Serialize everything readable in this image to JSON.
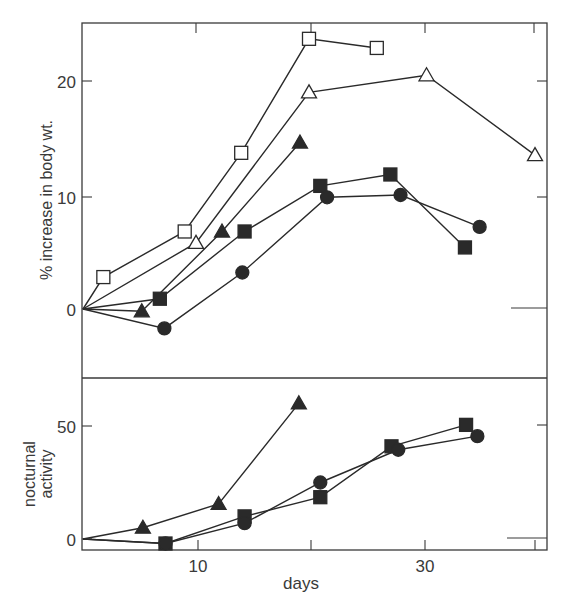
{
  "chart_data": [
    {
      "type": "line",
      "title": "",
      "xlabel": "",
      "ylabel": "% increase in body wt.",
      "xlim": [
        0,
        41
      ],
      "ylim": [
        -6,
        25
      ],
      "x_ticks": [
        10,
        20,
        30,
        40
      ],
      "y_ticks": [
        0,
        10,
        20
      ],
      "y_tick_labels": [
        "0",
        "10",
        "20"
      ],
      "grid": false,
      "legend": "none",
      "series": [
        {
          "name": "open-square",
          "marker": "open-square",
          "x": [
            0,
            1.8,
            9,
            14,
            20,
            26
          ],
          "y": [
            0,
            2.8,
            6.8,
            13.7,
            23.7,
            22.9
          ]
        },
        {
          "name": "open-triangle",
          "marker": "open-triangle",
          "x": [
            0,
            10,
            20,
            30.4,
            40
          ],
          "y": [
            0,
            5.8,
            19,
            20.5,
            13.5
          ]
        },
        {
          "name": "filled-triangle",
          "marker": "filled-triangle",
          "x": [
            0,
            5.2,
            12.3,
            19.2
          ],
          "y": [
            0,
            -0.2,
            6.8,
            14.6
          ]
        },
        {
          "name": "filled-square",
          "marker": "filled-square",
          "x": [
            0,
            6.8,
            14.3,
            21,
            27.2,
            33.8
          ],
          "y": [
            0,
            0.9,
            6.8,
            10.8,
            11.8,
            5.4
          ]
        },
        {
          "name": "filled-circle",
          "marker": "filled-circle",
          "x": [
            0,
            7.2,
            14.1,
            21.6,
            28.1,
            35.1
          ],
          "y": [
            0,
            -1.7,
            3.2,
            9.8,
            10.0,
            7.2
          ]
        }
      ]
    },
    {
      "type": "line",
      "title": "",
      "xlabel": "days",
      "ylabel": "nocturnal activity",
      "xlim": [
        0,
        41
      ],
      "ylim": [
        -5,
        70
      ],
      "x_ticks": [
        10,
        20,
        30,
        40
      ],
      "x_tick_labels": [
        "10",
        "",
        "30",
        ""
      ],
      "y_ticks": [
        0,
        50
      ],
      "y_tick_labels": [
        "0",
        "50"
      ],
      "grid": false,
      "legend": "none",
      "series": [
        {
          "name": "filled-triangle",
          "marker": "filled-triangle",
          "x": [
            0,
            5.3,
            12,
            19.1
          ],
          "y": [
            0,
            5,
            15.5,
            60
          ]
        },
        {
          "name": "filled-square",
          "marker": "filled-square",
          "x": [
            0,
            7.3,
            14.3,
            21,
            27.3,
            33.9
          ],
          "y": [
            0,
            -2,
            10,
            18.5,
            41,
            50.5
          ]
        },
        {
          "name": "filled-circle",
          "marker": "filled-circle",
          "x": [
            0,
            7.3,
            14.3,
            21,
            27.9,
            34.9
          ],
          "y": [
            0,
            -2,
            7,
            25,
            39.5,
            45.5
          ]
        }
      ]
    }
  ],
  "labels": {
    "top_ylabel": "% increase in body wt.",
    "bottom_ylabel_line1": "nocturnal",
    "bottom_ylabel_line2": "activity",
    "xlabel": "days",
    "top_ytick_0": "0",
    "top_ytick_10": "10",
    "top_ytick_20": "20",
    "bottom_ytick_0": "0",
    "bottom_ytick_50": "50",
    "xtick_10": "10",
    "xtick_30": "30"
  },
  "colors": {
    "ink": "#2a2a2a",
    "background": "#ffffff"
  }
}
